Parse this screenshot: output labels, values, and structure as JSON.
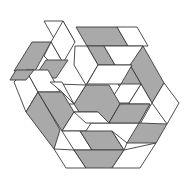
{
  "figure": {
    "colors": {
      "gray": "#a9a9a9",
      "white": "#ffffff",
      "stroke": "#3a3a3a",
      "background": "#ffffff"
    },
    "tiles": [
      {
        "fill": "white",
        "points": "44,21 63,21 75,42 56,42"
      },
      {
        "fill": "white",
        "points": "63,21 75,42 63,63 51,42"
      },
      {
        "fill": "gray",
        "points": "32,42 51,42 35,71 14,71"
      },
      {
        "fill": "white",
        "points": "51,42 63,63 58,70 44,56"
      },
      {
        "fill": "gray",
        "points": "46,60 68,60 56,78 34,78"
      },
      {
        "fill": "gray",
        "points": "76,27 117,27 128,46 87,46"
      },
      {
        "fill": "white",
        "points": "117,27 137,27 148,46 128,46"
      },
      {
        "fill": "gray",
        "points": "87,46 104,46 115,65 98,65"
      },
      {
        "fill": "white",
        "points": "104,46 143,46 132,65 115,65"
      },
      {
        "fill": "white",
        "points": "75,46 87,46 98,65 86,85 74,65"
      },
      {
        "fill": "gray",
        "points": "143,46 164,83 152,103 130,65"
      },
      {
        "fill": "gray",
        "points": "130,65 141,84 129,103 118,84"
      },
      {
        "fill": "white",
        "points": "152,103 164,83 179,103 167,124"
      },
      {
        "fill": "white",
        "points": "129,103 141,84 152,103 140,124"
      },
      {
        "fill": "white",
        "points": "98,65 132,65 121,84 87,84"
      },
      {
        "fill": "white",
        "points": "121,84 141,84 129,103 109,103"
      },
      {
        "fill": "gray",
        "points": "86,85 109,85 120,104 109,123 86,123 74,104"
      },
      {
        "fill": "white",
        "points": "57,84 86,85 74,104 62,104"
      },
      {
        "fill": "white",
        "points": "14,82 26,70 38,92 26,112"
      },
      {
        "fill": "white",
        "points": "26,70 48,70 60,92 38,92"
      },
      {
        "fill": "gray",
        "points": "26,112 38,92 60,130 54,149"
      },
      {
        "fill": "gray",
        "points": "38,92 50,112 62,131 74,112 62,92"
      },
      {
        "fill": "white",
        "points": "50,82 62,82 74,104 62,92"
      },
      {
        "fill": "white",
        "points": "62,131 74,112 98,112 86,131"
      },
      {
        "fill": "white",
        "points": "74,112 98,112 109,123 86,123"
      },
      {
        "fill": "white",
        "points": "62,131 80,131 92,150 74,150"
      },
      {
        "fill": "gray",
        "points": "80,131 112,131 124,150 92,150"
      },
      {
        "fill": "white",
        "points": "109,123 120,104 150,104 139,123"
      },
      {
        "fill": "gray",
        "points": "139,123 167,124 156,143 127,143"
      },
      {
        "fill": "gray",
        "points": "120,104 150,104 139,123 109,123"
      },
      {
        "fill": "white",
        "points": "54,149 74,150 86,168 66,168"
      },
      {
        "fill": "gray",
        "points": "74,150 124,150 112,168 86,168"
      },
      {
        "fill": "white",
        "points": "124,150 156,143 140,168 112,168"
      },
      {
        "fill": "white",
        "points": "112,131 127,143 124,150"
      },
      {
        "fill": "gray",
        "points": "16,70 34,70 26,80 10,80"
      }
    ]
  }
}
